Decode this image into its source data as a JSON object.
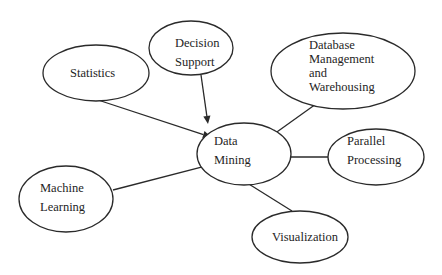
{
  "diagram": {
    "type": "concept-map",
    "central_node": "data_mining",
    "nodes": [
      {
        "id": "statistics",
        "lines": [
          "Statistics"
        ]
      },
      {
        "id": "decision_support",
        "lines": [
          "Decision",
          "Support"
        ]
      },
      {
        "id": "database_management",
        "lines": [
          "Database",
          "Management",
          "and",
          "Warehousing"
        ]
      },
      {
        "id": "data_mining",
        "lines": [
          "Data",
          "Mining"
        ]
      },
      {
        "id": "parallel_processing",
        "lines": [
          "Parallel",
          "Processing"
        ]
      },
      {
        "id": "machine_learning",
        "lines": [
          "Machine",
          "Learning"
        ]
      },
      {
        "id": "visualization",
        "lines": [
          "Visualization"
        ]
      }
    ],
    "edges": [
      {
        "from": "statistics",
        "to": "data_mining",
        "directed": true
      },
      {
        "from": "decision_support",
        "to": "data_mining",
        "directed": true
      },
      {
        "from": "database_management",
        "to": "data_mining",
        "directed": true
      },
      {
        "from": "parallel_processing",
        "to": "data_mining",
        "directed": true
      },
      {
        "from": "machine_learning",
        "to": "data_mining",
        "directed": true
      },
      {
        "from": "visualization",
        "to": "data_mining",
        "directed": true
      }
    ]
  }
}
